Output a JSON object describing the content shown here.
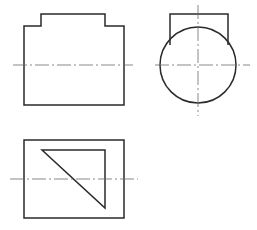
{
  "diagram": {
    "type": "orthographic-projection",
    "views": [
      {
        "name": "front-view",
        "outline_points": [
          [
            24,
            105
          ],
          [
            24,
            26
          ],
          [
            41,
            26
          ],
          [
            41,
            14
          ],
          [
            105,
            14
          ],
          [
            105,
            26
          ],
          [
            124,
            26
          ],
          [
            124,
            105
          ]
        ],
        "centerline_h": {
          "x1": 13,
          "x2": 133,
          "y": 65
        }
      },
      {
        "name": "side-view",
        "rect": {
          "x1": 170,
          "y1": 14,
          "x2": 228,
          "y2": 40
        },
        "circle": {
          "cx": 198,
          "cy": 65,
          "r": 38
        },
        "centerline_h": {
          "x1": 155,
          "x2": 250,
          "y": 65
        },
        "centerline_v": {
          "x": 198,
          "y1": 5,
          "y2": 116
        }
      },
      {
        "name": "top-view",
        "rect": {
          "x": 24,
          "y": 140,
          "w": 100,
          "h": 78
        },
        "triangle": [
          [
            42,
            150
          ],
          [
            105,
            150
          ],
          [
            105,
            208
          ]
        ],
        "centerline_h": {
          "x1": 10,
          "x2": 138,
          "y": 179
        }
      }
    ],
    "colors": {
      "outline": "#2a2a2a",
      "centerline": "#6a6a6a",
      "background": "#ffffff"
    }
  }
}
